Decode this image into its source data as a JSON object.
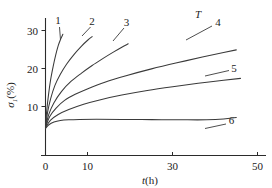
{
  "chart_data": {
    "type": "line",
    "title": "",
    "xlabel": "t(h)",
    "ylabel": "σ₁(%)",
    "xlim": [
      -2,
      54
    ],
    "ylim": [
      0,
      33
    ],
    "grid": false,
    "legend_position": "inline-end-labels",
    "annotations": [
      {
        "text": "T",
        "meaning": "temperature-increases-direction",
        "x": 40,
        "y": 31
      }
    ],
    "xticks": [
      0,
      10,
      30,
      50
    ],
    "xtick_labels": [
      "0",
      "10",
      "30",
      "50"
    ],
    "yticks": [
      10,
      20,
      30
    ],
    "ytick_labels": [
      "10",
      "20",
      "30"
    ],
    "series": [
      {
        "name": "1",
        "label": "1",
        "x": [
          0,
          0.3,
          0.7,
          1.2,
          1.8,
          2.4,
          3.0,
          3.6,
          4.1
        ],
        "values": [
          4.5,
          9.0,
          13.0,
          17.0,
          20.5,
          23.5,
          26.0,
          27.8,
          29.0
        ]
      },
      {
        "name": "2",
        "label": "2",
        "x": [
          0,
          0.5,
          1.2,
          2.2,
          3.5,
          5.0,
          6.8,
          8.5,
          10.0,
          11.0
        ],
        "values": [
          4.5,
          8.5,
          12.0,
          15.5,
          18.5,
          21.2,
          23.8,
          25.9,
          27.5,
          28.4
        ]
      },
      {
        "name": "3",
        "label": "3",
        "x": [
          0,
          0.8,
          2.0,
          3.8,
          6.0,
          8.5,
          11.0,
          13.5,
          16.0,
          18.0,
          19.5
        ],
        "values": [
          4.5,
          8.0,
          11.0,
          14.0,
          16.6,
          18.8,
          20.8,
          22.6,
          24.3,
          25.6,
          26.5
        ]
      },
      {
        "name": "4",
        "label": "4",
        "x": [
          0,
          1.0,
          2.5,
          4.5,
          7.0,
          10.0,
          14.0,
          19.0,
          25.0,
          31.0,
          37.0,
          42.0,
          45.0
        ],
        "values": [
          4.5,
          7.4,
          9.6,
          11.6,
          13.2,
          14.7,
          16.4,
          18.1,
          19.9,
          21.5,
          23.0,
          24.2,
          24.9
        ]
      },
      {
        "name": "5",
        "label": "5",
        "x": [
          0,
          1.2,
          3.0,
          5.5,
          9.0,
          13.0,
          18.0,
          24.0,
          30.0,
          36.0,
          42.0,
          46.0
        ],
        "values": [
          4.4,
          6.4,
          7.9,
          9.2,
          10.6,
          11.8,
          13.0,
          14.2,
          15.2,
          16.1,
          16.9,
          17.4
        ]
      },
      {
        "name": "6",
        "label": "6",
        "x": [
          0,
          0.8,
          2.0,
          3.5,
          5.5,
          8.0,
          12.0,
          18.0,
          25.0,
          32.0,
          38.0,
          42.0,
          45.0
        ],
        "values": [
          4.2,
          5.2,
          5.9,
          6.3,
          6.5,
          6.6,
          6.65,
          6.6,
          6.55,
          6.5,
          6.5,
          6.7,
          7.1
        ]
      }
    ]
  },
  "labels": {
    "y_axis_sigma": "σ",
    "y_axis_sub": "1",
    "y_axis_unit": "(%)",
    "x_axis_t": "t",
    "x_axis_unit": "(h)",
    "temperature_arrow": "T",
    "xtick_0": "0",
    "xtick_10": "10",
    "xtick_30": "30",
    "xtick_50": "50",
    "ytick_10": "10",
    "ytick_20": "20",
    "ytick_30": "30",
    "curve_1": "1",
    "curve_2": "2",
    "curve_3": "3",
    "curve_4": "4",
    "curve_5": "5",
    "curve_6": "6"
  },
  "colors": {
    "background": "#ffffff",
    "axis": "#2b2b2b",
    "curve": "#3a3a3a",
    "text": "#222222"
  }
}
